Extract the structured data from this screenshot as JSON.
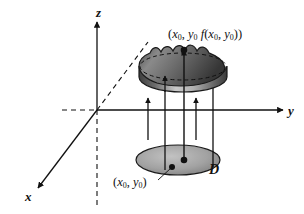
{
  "figure": {
    "background_color": "#ffffff",
    "ink_color": "#111111",
    "width": 304,
    "height": 214
  },
  "axes": {
    "x": {
      "label": "x",
      "direction": "down-left",
      "solid_from_origin": true,
      "dashed_continuation": "up-right"
    },
    "y": {
      "label": "y",
      "direction": "right",
      "solid_from_origin": true,
      "dashed_continuation": "left"
    },
    "z": {
      "label": "z",
      "direction": "up",
      "solid_from_origin": true,
      "dashed_continuation": "down"
    },
    "origin": {
      "x": 97,
      "y": 110
    }
  },
  "labels": {
    "surface_point": {
      "open_paren": "(",
      "x_base": "x",
      "x_sub": "0",
      "comma1": ", ",
      "y_base": "y",
      "y_sub": "0",
      "space": "  ",
      "f": "f",
      "f_open": "(",
      "fx_base": "x",
      "fx_sub": "0",
      "comma2": ", ",
      "fy_base": "y",
      "fy_sub": "0",
      "f_close": ")",
      "close_paren": ")",
      "plain_text": "(x0, y0 f(x0, y0))"
    },
    "domain_point": {
      "open_paren": "(",
      "x_base": "x",
      "x_sub": "0",
      "comma1": ", ",
      "y_base": "y",
      "y_sub": "0",
      "close_paren": ")",
      "plain_text": "(x0, y0)"
    },
    "region": "D"
  },
  "surface": {
    "name": "wavy-dome-surface",
    "description": "shaded dome with scalloped top rim and dashed equator ellipse",
    "fill_dark": "#4d4d4d",
    "fill_light": "#cfcfcf",
    "stroke": "#1a1a1a",
    "center": {
      "x": 183,
      "y": 77
    },
    "rx": 44,
    "ry": 15
  },
  "domain_disk": {
    "name": "domain-disk",
    "description": "shaded ellipse representing the region D in the xy-plane",
    "fill_dark": "#7d7d7d",
    "fill_light": "#b8b8b8",
    "stroke": "#1a1a1a",
    "center": {
      "x": 178,
      "y": 160
    },
    "rx": 42,
    "ry": 15
  },
  "projection_arrows": {
    "count": 5,
    "description": "vertical arrows rising from the disk D up to the surface",
    "items": [
      {
        "name": "short-arrow-left",
        "x": 148,
        "y_bottom": 140,
        "y_top": 98,
        "has_head": true,
        "kind": "short"
      },
      {
        "name": "long-arrow-left",
        "x": 165,
        "y_bottom": 170,
        "y_top": 83,
        "has_head": true,
        "kind": "long"
      },
      {
        "name": "center-arrow",
        "x": 184,
        "y_bottom": 161,
        "y_top": 53,
        "has_head": true,
        "kind": "center"
      },
      {
        "name": "short-arrow-right",
        "x": 196,
        "y_bottom": 140,
        "y_top": 98,
        "has_head": true,
        "kind": "short"
      },
      {
        "name": "plain-line-right",
        "x": 213,
        "y_bottom": 167,
        "y_top": 85,
        "has_head": false,
        "kind": "line"
      }
    ]
  },
  "markers": {
    "surface_point_dot": {
      "name": "surface-point-dot",
      "x": 184,
      "y": 53
    },
    "domain_point_dot": {
      "name": "domain-point-dot",
      "x": 184,
      "y": 160
    },
    "domain_label_dot": {
      "name": "domain-label-dot",
      "x": 172,
      "y": 167
    }
  },
  "leaders": {
    "domain_point_leader": {
      "name": "domain-point-leader",
      "x1": 160,
      "y1": 180,
      "x2": 172,
      "y2": 167
    }
  }
}
